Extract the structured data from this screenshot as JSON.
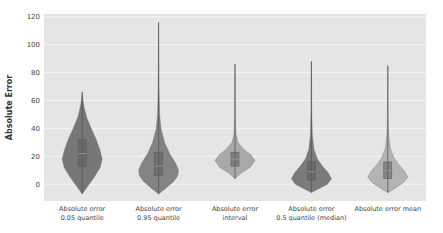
{
  "chart_data": {
    "type": "violin",
    "title": "",
    "xlabel": "",
    "ylabel": "Absolute Error",
    "ylim": [
      -12,
      122
    ],
    "yticks": [
      0,
      20,
      40,
      60,
      80,
      100,
      120
    ],
    "grid": true,
    "legend": "none",
    "plot_bg": "#e5e5e5",
    "grid_color": "#f5f5f5",
    "categories": [
      [
        "Absolute error",
        "0.05 quantile"
      ],
      [
        "Absolute error",
        "0.95 quantile"
      ],
      [
        "Absolute error",
        "interval"
      ],
      [
        "Absolute error",
        "0.5 quantile (median)"
      ],
      [
        "Absolute error mean"
      ]
    ],
    "series": [
      {
        "name": "Absolute error 0.05 quantile",
        "color": "#777777",
        "min": -7,
        "max": 66,
        "q1": 13,
        "median": 22,
        "q3": 32,
        "density": [
          [
            -7,
            0.0
          ],
          [
            -2,
            0.25
          ],
          [
            5,
            0.6
          ],
          [
            12,
            0.9
          ],
          [
            18,
            1.0
          ],
          [
            25,
            0.88
          ],
          [
            32,
            0.7
          ],
          [
            40,
            0.45
          ],
          [
            48,
            0.22
          ],
          [
            55,
            0.1
          ],
          [
            60,
            0.04
          ],
          [
            66,
            0.0
          ]
        ]
      },
      {
        "name": "Absolute error 0.95 quantile",
        "color": "#838383",
        "min": -7,
        "max": 116,
        "q1": 6,
        "median": 13,
        "q3": 23,
        "density": [
          [
            -7,
            0.0
          ],
          [
            -3,
            0.35
          ],
          [
            2,
            0.75
          ],
          [
            6,
            0.95
          ],
          [
            10,
            1.0
          ],
          [
            15,
            0.85
          ],
          [
            22,
            0.55
          ],
          [
            30,
            0.3
          ],
          [
            40,
            0.12
          ],
          [
            50,
            0.05
          ],
          [
            70,
            0.02
          ],
          [
            116,
            0.0
          ]
        ]
      },
      {
        "name": "Absolute error interval",
        "color": "#a9a9a9",
        "min": 4,
        "max": 86,
        "q1": 13,
        "median": 18,
        "q3": 23,
        "density": [
          [
            4,
            0.0
          ],
          [
            8,
            0.3
          ],
          [
            12,
            0.75
          ],
          [
            17,
            1.0
          ],
          [
            21,
            0.8
          ],
          [
            25,
            0.45
          ],
          [
            30,
            0.15
          ],
          [
            36,
            0.05
          ],
          [
            50,
            0.015
          ],
          [
            86,
            0.0
          ]
        ]
      },
      {
        "name": "Absolute error 0.5 quantile (median)",
        "color": "#7b7b7b",
        "min": -6,
        "max": 88,
        "q1": 3,
        "median": 9,
        "q3": 16,
        "density": [
          [
            -6,
            0.0
          ],
          [
            -3,
            0.4
          ],
          [
            0,
            0.8
          ],
          [
            4,
            1.0
          ],
          [
            8,
            0.85
          ],
          [
            13,
            0.55
          ],
          [
            18,
            0.3
          ],
          [
            25,
            0.13
          ],
          [
            35,
            0.05
          ],
          [
            50,
            0.02
          ],
          [
            88,
            0.0
          ]
        ]
      },
      {
        "name": "Absolute error mean",
        "color": "#b3b3b3",
        "min": -6,
        "max": 85,
        "q1": 4,
        "median": 10,
        "q3": 16,
        "density": [
          [
            -6,
            0.0
          ],
          [
            -3,
            0.35
          ],
          [
            1,
            0.75
          ],
          [
            5,
            1.0
          ],
          [
            9,
            0.85
          ],
          [
            14,
            0.55
          ],
          [
            19,
            0.3
          ],
          [
            26,
            0.12
          ],
          [
            36,
            0.04
          ],
          [
            50,
            0.015
          ],
          [
            85,
            0.0
          ]
        ]
      }
    ]
  }
}
